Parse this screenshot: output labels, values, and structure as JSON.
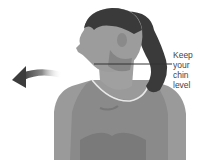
{
  "caption": {
    "line1": "Keep your",
    "line2": "chin level"
  },
  "illustration": {
    "subject": "woman-turning-head-left",
    "arrow_direction": "left"
  },
  "colors": {
    "skin": "#9a9a9a",
    "skin_dark": "#7a7a7a",
    "hair": "#3a3a3a",
    "top": "#8c8c8c",
    "arrow": "#555555",
    "line": "#333333"
  }
}
